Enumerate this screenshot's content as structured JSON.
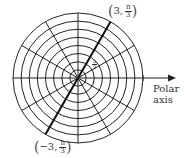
{
  "diagram": {
    "type": "polar-grid",
    "center": [
      78,
      78
    ],
    "outer_radius": 65,
    "ring_count": 8,
    "spoke_angle_step_deg": 30,
    "highlight_angle_deg": 60,
    "line_color": "#222222",
    "axis_label_line1": "Polar",
    "axis_label_line2": "axis",
    "point_a": {
      "r": "3",
      "theta_num": "π",
      "theta_den": "3",
      "prefix": "3,"
    },
    "point_b": {
      "r": "−3",
      "theta_num": "π",
      "theta_den": "3",
      "prefix": "−3,"
    },
    "angle_label": {
      "num": "π",
      "den": "3"
    }
  }
}
